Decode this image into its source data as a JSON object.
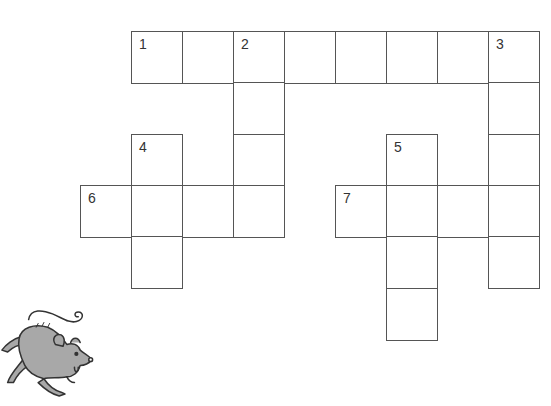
{
  "puzzle": {
    "type": "crossword",
    "cell_size": 51,
    "origin": {
      "x": 80,
      "y": 31
    },
    "cells": [
      {
        "row": 0,
        "col": 1,
        "number": "1"
      },
      {
        "row": 0,
        "col": 2,
        "number": ""
      },
      {
        "row": 0,
        "col": 3,
        "number": "2"
      },
      {
        "row": 0,
        "col": 4,
        "number": ""
      },
      {
        "row": 0,
        "col": 5,
        "number": ""
      },
      {
        "row": 0,
        "col": 6,
        "number": ""
      },
      {
        "row": 0,
        "col": 7,
        "number": ""
      },
      {
        "row": 0,
        "col": 8,
        "number": "3"
      },
      {
        "row": 1,
        "col": 3,
        "number": ""
      },
      {
        "row": 1,
        "col": 8,
        "number": ""
      },
      {
        "row": 2,
        "col": 1,
        "number": "4"
      },
      {
        "row": 2,
        "col": 3,
        "number": ""
      },
      {
        "row": 2,
        "col": 6,
        "number": "5"
      },
      {
        "row": 2,
        "col": 8,
        "number": ""
      },
      {
        "row": 3,
        "col": 0,
        "number": "6"
      },
      {
        "row": 3,
        "col": 1,
        "number": ""
      },
      {
        "row": 3,
        "col": 2,
        "number": ""
      },
      {
        "row": 3,
        "col": 3,
        "number": ""
      },
      {
        "row": 3,
        "col": 5,
        "number": "7"
      },
      {
        "row": 3,
        "col": 6,
        "number": ""
      },
      {
        "row": 3,
        "col": 7,
        "number": ""
      },
      {
        "row": 3,
        "col": 8,
        "number": ""
      },
      {
        "row": 4,
        "col": 1,
        "number": ""
      },
      {
        "row": 4,
        "col": 6,
        "number": ""
      },
      {
        "row": 4,
        "col": 8,
        "number": ""
      },
      {
        "row": 5,
        "col": 6,
        "number": ""
      }
    ]
  },
  "illustration": {
    "icon": "mouse-icon",
    "fill": "#a8a8a8",
    "stroke": "#333333"
  },
  "colors": {
    "grid_line": "#555555",
    "number": "#333333",
    "background": "#ffffff"
  }
}
